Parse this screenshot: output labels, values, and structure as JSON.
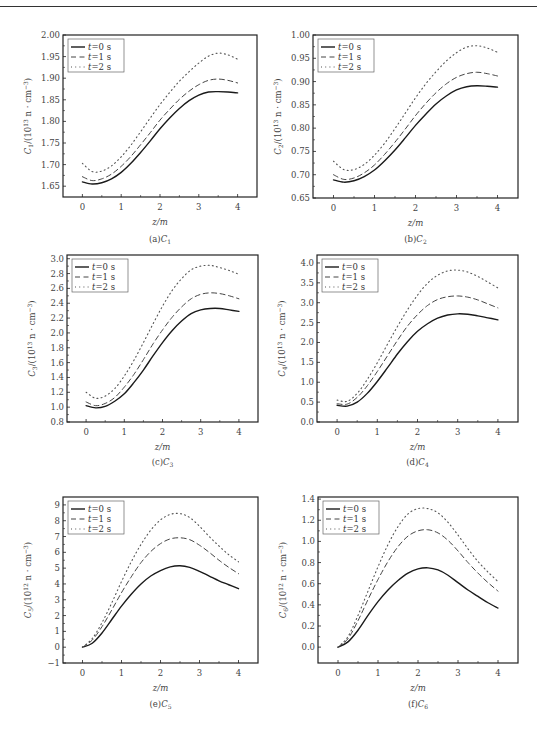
{
  "chart_data": [
    {
      "id": "a",
      "type": "line",
      "caption": "(a)C1",
      "xlabel": "z/m",
      "ylabel": "C1/(10^13 n · cm^-3)",
      "xlim": [
        -0.5,
        4.5
      ],
      "ylim": [
        1.625,
        2.0
      ],
      "xticks": [
        0,
        1,
        2,
        3,
        4
      ],
      "yticks": [
        1.65,
        1.7,
        1.75,
        1.8,
        1.85,
        1.9,
        1.95,
        2.0
      ],
      "ytick_labels": [
        "1.65",
        "1.70",
        "1.75",
        "1.80",
        "1.85",
        "1.90",
        "1.95",
        "2.00"
      ],
      "x": [
        0,
        0.25,
        0.5,
        0.75,
        1,
        1.25,
        1.5,
        1.75,
        2,
        2.25,
        2.5,
        2.75,
        3,
        3.25,
        3.5,
        3.75,
        4
      ],
      "series": [
        {
          "name": "t=0 s",
          "style": "solid",
          "values": [
            1.66,
            1.655,
            1.658,
            1.667,
            1.682,
            1.703,
            1.728,
            1.755,
            1.783,
            1.808,
            1.83,
            1.848,
            1.861,
            1.868,
            1.869,
            1.868,
            1.866
          ]
        },
        {
          "name": "t=1 s",
          "style": "dashed",
          "values": [
            1.672,
            1.663,
            1.667,
            1.678,
            1.696,
            1.719,
            1.746,
            1.774,
            1.803,
            1.828,
            1.851,
            1.87,
            1.885,
            1.895,
            1.898,
            1.895,
            1.889
          ]
        },
        {
          "name": "t=2 s",
          "style": "dotted",
          "values": [
            1.703,
            1.684,
            1.685,
            1.697,
            1.718,
            1.745,
            1.776,
            1.808,
            1.839,
            1.867,
            1.893,
            1.915,
            1.935,
            1.951,
            1.958,
            1.954,
            1.944
          ]
        }
      ],
      "legend": [
        "t=0 s",
        "t=1 s",
        "t=2 s"
      ],
      "legend_position": "upper-left",
      "grid": false
    },
    {
      "id": "b",
      "type": "line",
      "caption": "(b)C2",
      "xlabel": "z/m",
      "ylabel": "C2/(10^13 n · cm^-3)",
      "xlim": [
        -0.5,
        4.5
      ],
      "ylim": [
        0.65,
        1.0
      ],
      "xticks": [
        0,
        1,
        2,
        3,
        4
      ],
      "yticks": [
        0.65,
        0.7,
        0.75,
        0.8,
        0.85,
        0.9,
        0.95,
        1.0
      ],
      "ytick_labels": [
        "0.65",
        "0.70",
        "0.75",
        "0.80",
        "0.85",
        "0.90",
        "0.95",
        "1.00"
      ],
      "x": [
        0,
        0.25,
        0.5,
        0.75,
        1,
        1.25,
        1.5,
        1.75,
        2,
        2.25,
        2.5,
        2.75,
        3,
        3.25,
        3.5,
        3.75,
        4
      ],
      "series": [
        {
          "name": "t=0 s",
          "style": "solid",
          "values": [
            0.689,
            0.684,
            0.687,
            0.696,
            0.71,
            0.73,
            0.753,
            0.779,
            0.806,
            0.83,
            0.852,
            0.869,
            0.882,
            0.889,
            0.891,
            0.89,
            0.888
          ]
        },
        {
          "name": "t=1 s",
          "style": "dashed",
          "values": [
            0.7,
            0.69,
            0.693,
            0.704,
            0.721,
            0.744,
            0.77,
            0.798,
            0.827,
            0.853,
            0.876,
            0.895,
            0.909,
            0.917,
            0.92,
            0.917,
            0.912
          ]
        },
        {
          "name": "t=2 s",
          "style": "dotted",
          "values": [
            0.729,
            0.711,
            0.711,
            0.722,
            0.742,
            0.768,
            0.799,
            0.832,
            0.865,
            0.895,
            0.921,
            0.944,
            0.962,
            0.974,
            0.977,
            0.972,
            0.963
          ]
        }
      ],
      "legend": [
        "t=0 s",
        "t=1 s",
        "t=2 s"
      ],
      "legend_position": "upper-left",
      "grid": false
    },
    {
      "id": "c",
      "type": "line",
      "caption": "(c)C3",
      "xlabel": "z/m",
      "ylabel": "C3/(10^13 n · cm^-3)",
      "xlim": [
        -0.5,
        4.5
      ],
      "ylim": [
        0.8,
        3.05
      ],
      "xticks": [
        0,
        1,
        2,
        3,
        4
      ],
      "yticks": [
        0.8,
        1.0,
        1.2,
        1.4,
        1.6,
        1.8,
        2.0,
        2.2,
        2.4,
        2.6,
        2.8,
        3.0
      ],
      "ytick_labels": [
        "0.8",
        "1.0",
        "1.2",
        "1.4",
        "1.6",
        "1.8",
        "2.0",
        "2.2",
        "2.4",
        "2.6",
        "2.8",
        "3.0"
      ],
      "x": [
        0,
        0.25,
        0.5,
        0.75,
        1,
        1.25,
        1.5,
        1.75,
        2,
        2.25,
        2.5,
        2.75,
        3,
        3.25,
        3.5,
        3.75,
        4
      ],
      "series": [
        {
          "name": "t=0 s",
          "style": "solid",
          "values": [
            1.02,
            0.99,
            1.01,
            1.08,
            1.18,
            1.33,
            1.5,
            1.69,
            1.87,
            2.03,
            2.16,
            2.26,
            2.31,
            2.33,
            2.33,
            2.31,
            2.29
          ]
        },
        {
          "name": "t=1 s",
          "style": "dashed",
          "values": [
            1.07,
            1.02,
            1.05,
            1.13,
            1.27,
            1.44,
            1.64,
            1.85,
            2.04,
            2.21,
            2.35,
            2.46,
            2.52,
            2.54,
            2.53,
            2.5,
            2.46
          ]
        },
        {
          "name": "t=2 s",
          "style": "dotted",
          "values": [
            1.2,
            1.12,
            1.15,
            1.25,
            1.42,
            1.63,
            1.87,
            2.12,
            2.36,
            2.57,
            2.73,
            2.85,
            2.9,
            2.91,
            2.88,
            2.84,
            2.79
          ]
        }
      ],
      "legend": [
        "t=0 s",
        "t=1 s",
        "t=2 s"
      ],
      "legend_position": "upper-left",
      "grid": false
    },
    {
      "id": "d",
      "type": "line",
      "caption": "(d)C4",
      "xlabel": "z/m",
      "ylabel": "C4/(10^13 n · cm^-3)",
      "xlim": [
        -0.5,
        4.5
      ],
      "ylim": [
        0.0,
        4.2
      ],
      "xticks": [
        0,
        1,
        2,
        3,
        4
      ],
      "yticks": [
        0.0,
        0.5,
        1.0,
        1.5,
        2.0,
        2.5,
        3.0,
        3.5,
        4.0
      ],
      "ytick_labels": [
        "0.0",
        "0.5",
        "1.0",
        "1.5",
        "2.0",
        "2.5",
        "3.0",
        "3.5",
        "4.0"
      ],
      "x": [
        0,
        0.25,
        0.5,
        0.75,
        1,
        1.25,
        1.5,
        1.75,
        2,
        2.25,
        2.5,
        2.75,
        3,
        3.25,
        3.5,
        3.75,
        4
      ],
      "series": [
        {
          "name": "t=0 s",
          "style": "solid",
          "values": [
            0.42,
            0.4,
            0.5,
            0.72,
            1.02,
            1.36,
            1.71,
            2.02,
            2.28,
            2.47,
            2.61,
            2.69,
            2.72,
            2.71,
            2.67,
            2.62,
            2.57
          ]
        },
        {
          "name": "t=1 s",
          "style": "dashed",
          "values": [
            0.46,
            0.45,
            0.62,
            0.91,
            1.27,
            1.66,
            2.05,
            2.41,
            2.7,
            2.93,
            3.08,
            3.15,
            3.17,
            3.14,
            3.07,
            2.97,
            2.87
          ]
        },
        {
          "name": "t=2 s",
          "style": "dotted",
          "values": [
            0.55,
            0.52,
            0.72,
            1.07,
            1.49,
            1.95,
            2.4,
            2.82,
            3.19,
            3.49,
            3.69,
            3.8,
            3.82,
            3.77,
            3.66,
            3.52,
            3.37
          ]
        }
      ],
      "legend": [
        "t=0 s",
        "t=1 s",
        "t=2 s"
      ],
      "legend_position": "upper-left",
      "grid": false
    },
    {
      "id": "e",
      "type": "line",
      "caption": "(e)C5",
      "xlabel": "z/m",
      "ylabel": "C5/(10^12 n · cm^-3)",
      "xlim": [
        -0.5,
        4.5
      ],
      "ylim": [
        -1,
        9.5
      ],
      "xticks": [
        0,
        1,
        2,
        3,
        4
      ],
      "yticks": [
        -1,
        0,
        1,
        2,
        3,
        4,
        5,
        6,
        7,
        8,
        9
      ],
      "ytick_labels": [
        "−1",
        "0",
        "1",
        "2",
        "3",
        "4",
        "5",
        "6",
        "7",
        "8",
        "9"
      ],
      "x": [
        0,
        0.25,
        0.5,
        0.75,
        1,
        1.25,
        1.5,
        1.75,
        2,
        2.25,
        2.5,
        2.75,
        3,
        3.25,
        3.5,
        3.75,
        4
      ],
      "series": [
        {
          "name": "t=0 s",
          "style": "solid",
          "values": [
            0.0,
            0.25,
            0.9,
            1.75,
            2.6,
            3.35,
            4.0,
            4.5,
            4.85,
            5.08,
            5.15,
            5.05,
            4.8,
            4.5,
            4.2,
            3.95,
            3.7
          ]
        },
        {
          "name": "t=1 s",
          "style": "dashed",
          "values": [
            0.0,
            0.45,
            1.3,
            2.35,
            3.45,
            4.45,
            5.35,
            6.05,
            6.55,
            6.85,
            6.92,
            6.8,
            6.45,
            6.0,
            5.5,
            5.05,
            4.65
          ]
        },
        {
          "name": "t=2 s",
          "style": "dotted",
          "values": [
            0.0,
            0.55,
            1.55,
            2.8,
            4.15,
            5.4,
            6.5,
            7.4,
            8.05,
            8.4,
            8.45,
            8.2,
            7.65,
            7.0,
            6.4,
            5.85,
            5.4
          ]
        }
      ],
      "legend": [
        "t=0 s",
        "t=1 s",
        "t=2 s"
      ],
      "legend_position": "upper-left",
      "grid": false
    },
    {
      "id": "f",
      "type": "line",
      "caption": "(f)C6",
      "xlabel": "z/m",
      "ylabel": "C6/(10^12 n · cm^-3)",
      "xlim": [
        -0.5,
        4.5
      ],
      "ylim": [
        -0.15,
        1.42
      ],
      "xticks": [
        0,
        1,
        2,
        3,
        4
      ],
      "yticks": [
        0.0,
        0.2,
        0.4,
        0.6,
        0.8,
        1.0,
        1.2,
        1.4
      ],
      "ytick_labels": [
        "0.0",
        "0.2",
        "0.4",
        "0.6",
        "0.8",
        "1.0",
        "1.2",
        "1.4"
      ],
      "x": [
        0,
        0.25,
        0.5,
        0.75,
        1,
        1.25,
        1.5,
        1.75,
        2,
        2.25,
        2.5,
        2.75,
        3,
        3.25,
        3.5,
        3.75,
        4
      ],
      "series": [
        {
          "name": "t=0 s",
          "style": "solid",
          "values": [
            0.0,
            0.05,
            0.16,
            0.3,
            0.43,
            0.54,
            0.63,
            0.7,
            0.74,
            0.75,
            0.73,
            0.68,
            0.61,
            0.54,
            0.48,
            0.42,
            0.37
          ]
        },
        {
          "name": "t=1 s",
          "style": "dashed",
          "values": [
            0.0,
            0.08,
            0.25,
            0.45,
            0.64,
            0.81,
            0.95,
            1.05,
            1.1,
            1.11,
            1.08,
            1.01,
            0.91,
            0.8,
            0.7,
            0.61,
            0.53
          ]
        },
        {
          "name": "t=2 s",
          "style": "dotted",
          "values": [
            0.0,
            0.1,
            0.3,
            0.53,
            0.76,
            0.97,
            1.14,
            1.26,
            1.31,
            1.31,
            1.27,
            1.18,
            1.06,
            0.93,
            0.81,
            0.71,
            0.62
          ]
        }
      ],
      "legend": [
        "t=0 s",
        "t=1 s",
        "t=2 s"
      ],
      "legend_position": "upper-left",
      "grid": false
    }
  ],
  "panels": [
    {
      "caption_prefix": "(a)",
      "caption_var": "C",
      "caption_sub": "1",
      "ylabel_var": "C",
      "ylabel_sub": "1",
      "ylabel_unit": "/(10",
      "ylabel_exp": "13",
      "ylabel_rest": " n · cm",
      "ylabel_rest_exp": "−3",
      "ylabel_close": ")"
    },
    {
      "caption_prefix": "(b)",
      "caption_var": "C",
      "caption_sub": "2",
      "ylabel_var": "C",
      "ylabel_sub": "2",
      "ylabel_unit": "/(10",
      "ylabel_exp": "13",
      "ylabel_rest": " n · cm",
      "ylabel_rest_exp": "−3",
      "ylabel_close": ")"
    },
    {
      "caption_prefix": "(c)",
      "caption_var": "C",
      "caption_sub": "3",
      "ylabel_var": "C",
      "ylabel_sub": "3",
      "ylabel_unit": "/(10",
      "ylabel_exp": "13",
      "ylabel_rest": " n · cm",
      "ylabel_rest_exp": "−3",
      "ylabel_close": ")"
    },
    {
      "caption_prefix": "(d)",
      "caption_var": "C",
      "caption_sub": "4",
      "ylabel_var": "C",
      "ylabel_sub": "4",
      "ylabel_unit": "/(10",
      "ylabel_exp": "13",
      "ylabel_rest": " n · cm",
      "ylabel_rest_exp": "−3",
      "ylabel_close": ")"
    },
    {
      "caption_prefix": "(e)",
      "caption_var": "C",
      "caption_sub": "5",
      "ylabel_var": "C",
      "ylabel_sub": "5",
      "ylabel_unit": "/(10",
      "ylabel_exp": "12",
      "ylabel_rest": " n · cm",
      "ylabel_rest_exp": "−3",
      "ylabel_close": ")"
    },
    {
      "caption_prefix": "(f)",
      "caption_var": "C",
      "caption_sub": "6",
      "ylabel_var": "C",
      "ylabel_sub": "6",
      "ylabel_unit": "/(10",
      "ylabel_exp": "12",
      "ylabel_rest": " n · cm",
      "ylabel_rest_exp": "−3",
      "ylabel_close": ")"
    }
  ],
  "legend_labels": [
    "t=0 s",
    "t=1 s",
    "t=2 s"
  ],
  "colors": {
    "line": "#1a1a1a",
    "dash": "#444444",
    "dot": "#555555",
    "axis": "#222222",
    "text": "#444444"
  }
}
